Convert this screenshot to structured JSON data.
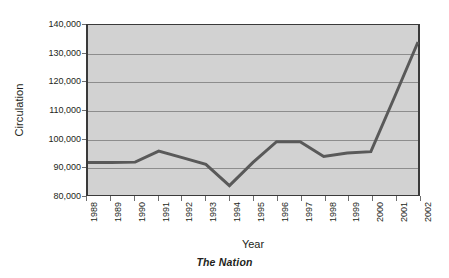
{
  "chart_data": {
    "type": "line",
    "title": "",
    "subtitle": "",
    "caption": "The Nation",
    "xlabel": "Year",
    "ylabel": "Circulation",
    "grid": true,
    "legend": false,
    "legend_position": "none",
    "line_color": "#595959",
    "plot_background": "#d2d2d2",
    "gridline_color": "#8d8d8d",
    "axis_color": "#3a3a3a",
    "ylim": [
      80000,
      140000
    ],
    "ytick_step": 10000,
    "ytick_labels": [
      "140,000",
      "130,000",
      "120,000",
      "110,000",
      "100,000",
      "90,000",
      "80,000"
    ],
    "ytick_values": [
      140000,
      130000,
      120000,
      110000,
      100000,
      90000,
      80000
    ],
    "categories": [
      "1988",
      "1989",
      "1990",
      "1991",
      "1992",
      "1993",
      "1994",
      "1995",
      "1996",
      "1997",
      "1998",
      "1999",
      "2000",
      "2001",
      "2002"
    ],
    "x": [
      1988,
      1989,
      1990,
      1991,
      1992,
      1993,
      1994,
      1995,
      1996,
      1997,
      1998,
      1999,
      2000,
      2001,
      2002
    ],
    "values": [
      91500,
      91500,
      91600,
      95500,
      93200,
      90800,
      83300,
      91500,
      98800,
      98800,
      93600,
      94800,
      95300,
      114500,
      134000
    ],
    "series": [
      {
        "name": "Circulation",
        "values": [
          91500,
          91500,
          91600,
          95500,
          93200,
          90800,
          83300,
          91500,
          98800,
          98800,
          93600,
          94800,
          95300,
          114500,
          134000
        ]
      }
    ],
    "annotations": []
  }
}
